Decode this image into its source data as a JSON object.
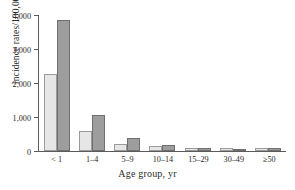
{
  "chart_data": {
    "type": "bar",
    "title": "",
    "subtitle": "",
    "xlabel": "Age group, yr",
    "ylabel": "Incidence rates/100,000",
    "categories": [
      "< 1",
      "1–4",
      "5–9",
      "10–14",
      "15–29",
      "30–49",
      "≥50"
    ],
    "series": [
      {
        "name": "series-1",
        "color": "#e6e6e6",
        "values": [
          2270,
          600,
          220,
          150,
          100,
          95,
          75
        ]
      },
      {
        "name": "series-2",
        "color": "#9d9d9d",
        "values": [
          3850,
          1060,
          380,
          170,
          75,
          55,
          85
        ]
      }
    ],
    "ylim": [
      0,
      4000
    ],
    "yticks": [
      0,
      1000,
      2000,
      3000,
      4000
    ],
    "ytick_labels": [
      "0",
      "1,000",
      "2,000",
      "3,000",
      "4,000"
    ],
    "grid": false,
    "legend": "none",
    "axis_color": "#5b5b5b",
    "background": "#ffffff"
  }
}
